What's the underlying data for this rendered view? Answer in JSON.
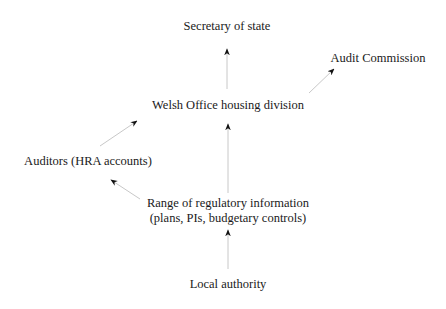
{
  "diagram": {
    "type": "flow",
    "nodes": {
      "secretary": {
        "label": "Secretary of state"
      },
      "audit_commission": {
        "label": "Audit Commission"
      },
      "welsh_office": {
        "label": "Welsh Office housing division"
      },
      "auditors": {
        "label": "Auditors (HRA accounts)"
      },
      "range_info": {
        "line1": "Range of regulatory information",
        "line2": "(plans, PIs, budgetary controls)"
      },
      "local_authority": {
        "label": "Local authority"
      }
    },
    "edges": [
      {
        "from": "welsh_office",
        "to": "secretary"
      },
      {
        "from": "welsh_office",
        "to": "audit_commission"
      },
      {
        "from": "auditors",
        "to": "welsh_office"
      },
      {
        "from": "range_info",
        "to": "welsh_office"
      },
      {
        "from": "range_info",
        "to": "auditors"
      },
      {
        "from": "local_authority",
        "to": "range_info"
      }
    ],
    "colors": {
      "text": "#1a1a1a",
      "arrow_line": "#c8c8c8",
      "arrow_head": "#111111"
    }
  }
}
